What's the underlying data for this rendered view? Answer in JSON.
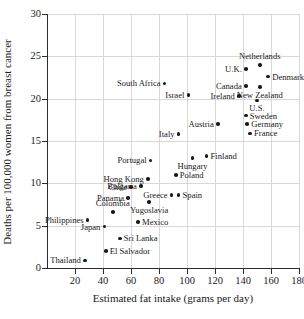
{
  "chart_data": {
    "type": "scatter",
    "title": "",
    "xlabel": "Estimated fat intake (grams per day)",
    "ylabel": "Deaths per 100,000 women from breast cancer",
    "xlim": [
      0,
      180
    ],
    "ylim": [
      0,
      30
    ],
    "xticks": [
      20,
      40,
      60,
      80,
      100,
      120,
      140,
      160,
      180
    ],
    "yticks": [
      0,
      5,
      10,
      15,
      20,
      25,
      30
    ],
    "grid": true,
    "legend": "none",
    "point_color": "#1a1a1a",
    "grid_color": "#d8d8d8",
    "axis_color": "#2b2b2b",
    "points": [
      {
        "name": "Netherlands",
        "x": 152,
        "y": 24.0,
        "label_pos": "above"
      },
      {
        "name": "U.K.",
        "x": 142,
        "y": 23.5,
        "label_pos": "left"
      },
      {
        "name": "Denmark",
        "x": 158,
        "y": 22.6,
        "label_pos": "right"
      },
      {
        "name": "Canada",
        "x": 142,
        "y": 21.5,
        "label_pos": "left"
      },
      {
        "name": "New Zealand",
        "x": 152,
        "y": 21.4,
        "label_pos": "below"
      },
      {
        "name": "South Africa",
        "x": 84,
        "y": 21.8,
        "label_pos": "left"
      },
      {
        "name": "Ireland",
        "x": 137,
        "y": 20.3,
        "label_pos": "left"
      },
      {
        "name": "Israel",
        "x": 101,
        "y": 20.4,
        "label_pos": "left"
      },
      {
        "name": "U.S.",
        "x": 150,
        "y": 19.8,
        "label_pos": "below"
      },
      {
        "name": "Sweden",
        "x": 142,
        "y": 18.0,
        "label_pos": "right"
      },
      {
        "name": "Germany",
        "x": 143,
        "y": 17.0,
        "label_pos": "right"
      },
      {
        "name": "Austria",
        "x": 122,
        "y": 17.0,
        "label_pos": "left"
      },
      {
        "name": "France",
        "x": 145,
        "y": 15.9,
        "label_pos": "right"
      },
      {
        "name": "Italy",
        "x": 94,
        "y": 15.8,
        "label_pos": "left"
      },
      {
        "name": "Finland",
        "x": 114,
        "y": 13.2,
        "label_pos": "right"
      },
      {
        "name": "Hungary",
        "x": 104,
        "y": 13.0,
        "label_pos": "below"
      },
      {
        "name": "Portugal",
        "x": 74,
        "y": 12.7,
        "label_pos": "left"
      },
      {
        "name": "Poland",
        "x": 92,
        "y": 11.0,
        "label_pos": "right"
      },
      {
        "name": "Hong Kong",
        "x": 72,
        "y": 10.5,
        "label_pos": "left"
      },
      {
        "name": "Bulgaria",
        "x": 67,
        "y": 9.7,
        "label_pos": "left"
      },
      {
        "name": "Chile",
        "x": 60,
        "y": 9.6,
        "label_pos": "left"
      },
      {
        "name": "Greece",
        "x": 89,
        "y": 8.6,
        "label_pos": "left"
      },
      {
        "name": "Spain",
        "x": 94,
        "y": 8.6,
        "label_pos": "right"
      },
      {
        "name": "Panama",
        "x": 58,
        "y": 8.3,
        "label_pos": "left"
      },
      {
        "name": "Yugoslavia",
        "x": 73,
        "y": 7.8,
        "label_pos": "below"
      },
      {
        "name": "Colombia",
        "x": 47,
        "y": 6.6,
        "label_pos": "above"
      },
      {
        "name": "Philippines",
        "x": 29,
        "y": 5.7,
        "label_pos": "left"
      },
      {
        "name": "Mexico",
        "x": 65,
        "y": 5.4,
        "label_pos": "right"
      },
      {
        "name": "Japan",
        "x": 41,
        "y": 4.9,
        "label_pos": "left"
      },
      {
        "name": "Sri Lanka",
        "x": 52,
        "y": 3.5,
        "label_pos": "right"
      },
      {
        "name": "El Salvador",
        "x": 42,
        "y": 2.0,
        "label_pos": "right"
      },
      {
        "name": "Thailand",
        "x": 27,
        "y": 0.9,
        "label_pos": "left"
      }
    ]
  }
}
